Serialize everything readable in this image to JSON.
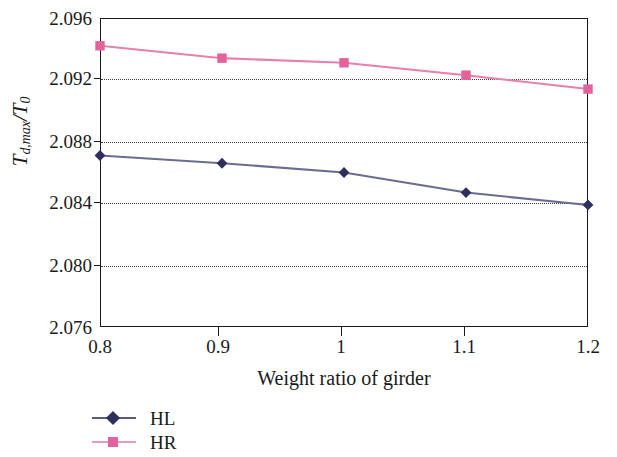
{
  "chart_data": {
    "type": "line",
    "title": "",
    "xlabel": "Weight ratio of girder",
    "ylabel": "T_{d,max}/T_0",
    "ylabel_parts": {
      "main": "T",
      "sub": "d,max",
      "divider": "/",
      "denom": "T",
      "denom_sub": "0"
    },
    "x": [
      0.8,
      0.9,
      1,
      1.1,
      1.2
    ],
    "xtick_labels": [
      "0.8",
      "0.9",
      "1",
      "1.1",
      "1.2"
    ],
    "xlim": [
      0.8,
      1.2
    ],
    "ylim": [
      2.076,
      2.096
    ],
    "ytick_labels": [
      "2.096",
      "2.092",
      "2.088",
      "2.084",
      "2.080",
      "2.076"
    ],
    "yticks": [
      2.096,
      2.092,
      2.088,
      2.084,
      2.08,
      2.076
    ],
    "grid": "horizontal-dotted",
    "legend_position": "below-left",
    "series": [
      {
        "name": "HL",
        "color": "#5a5a84",
        "marker": "diamond",
        "values": [
          2.0871,
          2.0866,
          2.086,
          2.0847,
          2.0839
        ]
      },
      {
        "name": "HR",
        "color": "#e2629b",
        "marker": "square",
        "values": [
          2.0942,
          2.0934,
          2.0931,
          2.0923,
          2.0914
        ]
      }
    ]
  },
  "legend": {
    "items": [
      {
        "label": "HL",
        "color": "#5a5a84",
        "marker": "diamond"
      },
      {
        "label": "HR",
        "color": "#e2629b",
        "marker": "square"
      }
    ]
  },
  "axes": {
    "y_tick_0": "2.096",
    "y_tick_1": "2.092",
    "y_tick_2": "2.088",
    "y_tick_3": "2.084",
    "y_tick_4": "2.080",
    "y_tick_5": "2.076",
    "x_tick_0": "0.8",
    "x_tick_1": "0.9",
    "x_tick_2": "1",
    "x_tick_3": "1.1",
    "x_tick_4": "1.2",
    "x_axis_title": "Weight ratio of girder"
  }
}
